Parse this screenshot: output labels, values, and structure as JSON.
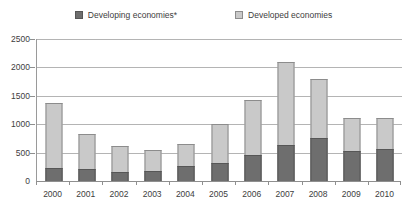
{
  "chart_data": {
    "type": "bar",
    "stacked": true,
    "title": "",
    "xlabel": "",
    "ylabel": "",
    "ylim": [
      0,
      2500
    ],
    "yticks": [
      0,
      500,
      1000,
      1500,
      2000,
      2500
    ],
    "grid": true,
    "legend_position": "top-center",
    "categories": [
      "2000",
      "2001",
      "2002",
      "2003",
      "2004",
      "2005",
      "2006",
      "2007",
      "2008",
      "2009",
      "2010"
    ],
    "series": [
      {
        "name": "Developing economies*",
        "color": "#6e6e6e",
        "values": [
          230,
          215,
          165,
          175,
          265,
          320,
          450,
          640,
          750,
          530,
          560
        ]
      },
      {
        "name": "Developed economies",
        "color": "#c9c9c9",
        "values": [
          1150,
          605,
          460,
          370,
          385,
          680,
          970,
          1450,
          1040,
          585,
          555
        ]
      }
    ],
    "totals": [
      1380,
      820,
      625,
      545,
      650,
      1000,
      1420,
      2090,
      1790,
      1115,
      1115
    ]
  },
  "legend": {
    "items": [
      {
        "label": "Developing economies*",
        "swatch": "developing-swatch"
      },
      {
        "label": "Developed economies",
        "swatch": "developed-swatch"
      }
    ]
  },
  "axes": {
    "y": {
      "ticks": [
        "2500",
        "2000",
        "1500",
        "1000",
        "500",
        "0"
      ]
    },
    "x": {
      "ticks": [
        "2000",
        "2001",
        "2002",
        "2003",
        "2004",
        "2005",
        "2006",
        "2007",
        "2008",
        "2009",
        "2010"
      ]
    }
  },
  "colors": {
    "developing": "#6e6e6e",
    "developed": "#c9c9c9",
    "gridline": "#b4b4b4",
    "axis": "#8f8f8f",
    "text": "#3d3d3d"
  }
}
